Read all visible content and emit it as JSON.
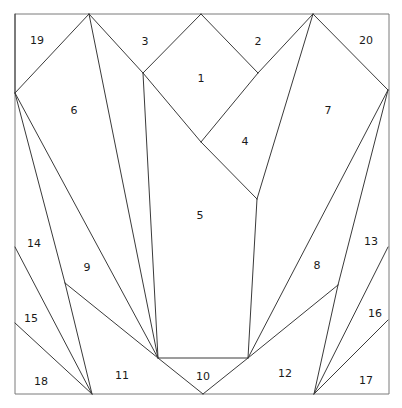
{
  "figure": {
    "canvas": {
      "width": 402,
      "height": 408
    },
    "style": {
      "background": "#ffffff",
      "stroke": "#3a3a3a",
      "border_stroke": "#7a7a7a",
      "stroke_width": 1,
      "label_color": "#1a1a1a",
      "label_size": 11
    },
    "border": {
      "name": "outer-square",
      "points": "15,14 389,14 389,394 15,394"
    },
    "vertices": {
      "tl": [
        15,
        14
      ],
      "tr": [
        389,
        14
      ],
      "bl": [
        15,
        394
      ],
      "br": [
        389,
        394
      ],
      "top_apex_left": [
        89,
        14
      ],
      "top_apex_right": [
        313,
        14
      ],
      "diamond_top": [
        201,
        14
      ],
      "diamond_left": [
        143,
        73
      ],
      "diamond_right": [
        258,
        73
      ],
      "diamond_bottom": [
        201,
        142
      ],
      "left_hub": [
        15,
        93
      ],
      "right_hub": [
        388,
        90
      ],
      "left_edge_a": [
        15,
        247
      ],
      "left_edge_b": [
        15,
        323
      ],
      "right_edge_a": [
        388,
        247
      ],
      "right_edge_b": [
        388,
        320
      ],
      "left_branch": [
        65,
        283
      ],
      "right_branch": [
        338,
        285
      ],
      "bottom_left_hub": [
        92,
        394
      ],
      "bottom_right_hub": [
        314,
        394
      ],
      "trap_left": [
        158,
        358
      ],
      "trap_right": [
        248,
        358
      ],
      "bottom_apex": [
        203,
        394
      ],
      "region4_bottom": [
        257,
        199
      ]
    },
    "edges": [
      {
        "name": "edge-tl-to-lefthub",
        "d": "M15,14 L15,93"
      },
      {
        "name": "edge-lefthub-to-topapexleft",
        "d": "M15,93 L89,14"
      },
      {
        "name": "edge-topapexleft-to-diamondleft",
        "d": "M89,14 L143,73"
      },
      {
        "name": "edge-diamondleft-to-diamondtop",
        "d": "M143,73 L201,14"
      },
      {
        "name": "edge-diamondtop-to-diamondright",
        "d": "M201,14 L258,73"
      },
      {
        "name": "edge-diamondright-to-topapexright",
        "d": "M258,73 L313,14"
      },
      {
        "name": "edge-topapexright-to-righthub",
        "d": "M313,14 L388,90"
      },
      {
        "name": "edge-diamondleft-to-diamondbottom",
        "d": "M143,73 L201,142"
      },
      {
        "name": "edge-diamondright-to-diamondbottom",
        "d": "M258,73 L201,142"
      },
      {
        "name": "edge-diamondbottom-to-region4bottom",
        "d": "M201,142 L257,199"
      },
      {
        "name": "edge-diamondleft-to-traplleft",
        "d": "M143,73 L158,358"
      },
      {
        "name": "edge-topapexleft-to-trapleft",
        "d": "M89,14 L158,358"
      },
      {
        "name": "edge-topapexright-to-region4bottom",
        "d": "M313,14 L257,199"
      },
      {
        "name": "edge-region4bottom-to-trapright",
        "d": "M257,199 L248,358"
      },
      {
        "name": "edge-lefthub-to-trapleft",
        "d": "M15,93 L158,358"
      },
      {
        "name": "edge-lefthub-to-leftbranch",
        "d": "M15,93 L65,283"
      },
      {
        "name": "edge-leftbranch-to-bottomlefthub",
        "d": "M65,283 L92,394"
      },
      {
        "name": "edge-leftbranch-to-trapleft",
        "d": "M65,283 L158,358"
      },
      {
        "name": "edge-leftedgea-to-bottomlefthub",
        "d": "M15,247 L92,394"
      },
      {
        "name": "edge-leftedgeb-to-bottomlefthub",
        "d": "M15,323 L92,394"
      },
      {
        "name": "edge-righthub-to-trapright",
        "d": "M388,90 L248,358"
      },
      {
        "name": "edge-righthub-to-rightbranch",
        "d": "M388,90 L338,285"
      },
      {
        "name": "edge-rightbranch-to-bottomrighthub",
        "d": "M338,285 L314,394"
      },
      {
        "name": "edge-rightbranch-to-trapright",
        "d": "M338,285 L248,358"
      },
      {
        "name": "edge-rightedgea-to-bottomrighthub",
        "d": "M388,247 L314,394"
      },
      {
        "name": "edge-rightedgeb-to-bottomrighthub",
        "d": "M388,320 L314,394"
      },
      {
        "name": "edge-trapezoid-top",
        "d": "M158,358 L248,358"
      },
      {
        "name": "edge-trapleft-to-bottomapex",
        "d": "M158,358 L203,394"
      },
      {
        "name": "edge-trapright-to-bottomapex",
        "d": "M248,358 L203,394"
      }
    ],
    "labels": [
      {
        "id": "1",
        "text": "1",
        "x": 201,
        "y": 78
      },
      {
        "id": "2",
        "text": "2",
        "x": 258,
        "y": 41
      },
      {
        "id": "3",
        "text": "3",
        "x": 145,
        "y": 41
      },
      {
        "id": "4",
        "text": "4",
        "x": 245,
        "y": 141
      },
      {
        "id": "5",
        "text": "5",
        "x": 200,
        "y": 215
      },
      {
        "id": "6",
        "text": "6",
        "x": 74,
        "y": 110
      },
      {
        "id": "7",
        "text": "7",
        "x": 328,
        "y": 110
      },
      {
        "id": "8",
        "text": "8",
        "x": 317,
        "y": 265
      },
      {
        "id": "9",
        "text": "9",
        "x": 87,
        "y": 267
      },
      {
        "id": "10",
        "text": "10",
        "x": 203,
        "y": 376
      },
      {
        "id": "11",
        "text": "11",
        "x": 122,
        "y": 375
      },
      {
        "id": "12",
        "text": "12",
        "x": 285,
        "y": 373
      },
      {
        "id": "13",
        "text": "13",
        "x": 371,
        "y": 241
      },
      {
        "id": "14",
        "text": "14",
        "x": 34,
        "y": 243
      },
      {
        "id": "15",
        "text": "15",
        "x": 31,
        "y": 318
      },
      {
        "id": "16",
        "text": "16",
        "x": 375,
        "y": 313
      },
      {
        "id": "17",
        "text": "17",
        "x": 366,
        "y": 380
      },
      {
        "id": "18",
        "text": "18",
        "x": 41,
        "y": 381
      },
      {
        "id": "19",
        "text": "19",
        "x": 37,
        "y": 40
      },
      {
        "id": "20",
        "text": "20",
        "x": 366,
        "y": 40
      }
    ]
  }
}
